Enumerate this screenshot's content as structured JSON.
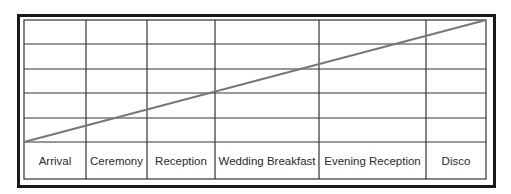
{
  "diagram": {
    "type": "timeline-grid",
    "row_count": 5,
    "columns": [
      {
        "label": "Arrival"
      },
      {
        "label": "Ceremony"
      },
      {
        "label": "Reception"
      },
      {
        "label": "Wedding Breakfast"
      },
      {
        "label": "Evening Reception"
      },
      {
        "label": "Disco"
      }
    ],
    "trend_line": {
      "from": "bottom-left",
      "to": "top-right",
      "color": "#777777"
    },
    "colors": {
      "grid": "#333333",
      "frame": "#1a1a1a",
      "line": "#777777",
      "text": "#2a2a2a"
    }
  }
}
